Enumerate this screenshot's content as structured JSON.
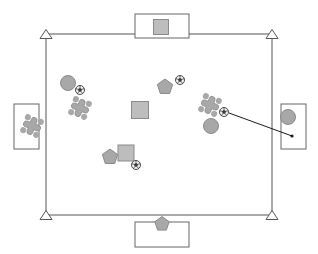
{
  "scene": {
    "title": "Soccer field tactical diagram",
    "canvas": {
      "width": 318,
      "height": 254,
      "background": "#ffffff"
    },
    "colors": {
      "line": "#555555",
      "shape_fill": "#a8a8a8",
      "shape_stroke": "#8a8a8a",
      "square_fill": "#bdbdbd",
      "goal_stroke": "#666666",
      "ball_dark": "#3a3a3a",
      "ball_light": "#f2f2f2",
      "pass_line": "#1a1a1a"
    }
  },
  "field": {
    "label": "playing field boundary",
    "left": 46,
    "top": 34,
    "right": 272,
    "bottom": 215,
    "stroke_width": 1
  },
  "corners": [
    {
      "name": "corner-marker-top-left",
      "label": "top left corner flag",
      "x": 46,
      "y": 34
    },
    {
      "name": "corner-marker-top-right",
      "label": "top right corner flag",
      "x": 272,
      "y": 34
    },
    {
      "name": "corner-marker-bottom-left",
      "label": "bottom left corner flag",
      "x": 46,
      "y": 215
    },
    {
      "name": "corner-marker-bottom-right",
      "label": "bottom right corner flag",
      "x": 272,
      "y": 215
    }
  ],
  "goals": [
    {
      "name": "goal-box-top",
      "label": "top goal box",
      "x": 135,
      "y": 14,
      "width": 54,
      "height": 24,
      "occupant": {
        "type": "square",
        "label": "square token in top goal",
        "cx": 161,
        "cy": 27,
        "size": 15
      }
    },
    {
      "name": "goal-box-bottom",
      "label": "bottom goal box",
      "x": 135,
      "y": 222,
      "width": 54,
      "height": 25,
      "occupant": {
        "type": "pentagon",
        "label": "pentagon token in bottom goal",
        "cx": 162,
        "cy": 224,
        "size": 15
      }
    },
    {
      "name": "goal-box-left",
      "label": "left goal box",
      "x": 14,
      "y": 104,
      "width": 25,
      "height": 45,
      "occupant": {
        "type": "cross",
        "label": "cross token in left goal",
        "cx": 32,
        "cy": 126,
        "size": 17
      }
    },
    {
      "name": "goal-box-right",
      "label": "right goal box",
      "x": 281,
      "y": 104,
      "width": 25,
      "height": 45,
      "occupant": {
        "type": "circle",
        "label": "circle token in right goal",
        "cx": 288,
        "cy": 117,
        "size": 15
      }
    }
  ],
  "tokens": [
    {
      "name": "token-circle-upper-left",
      "type": "circle",
      "label": "circle player upper left",
      "cx": 68,
      "cy": 83,
      "size": 15
    },
    {
      "name": "token-ball-upper-left",
      "type": "ball",
      "label": "ball near upper left circle",
      "cx": 80,
      "cy": 90,
      "size": 9
    },
    {
      "name": "token-cross-left",
      "type": "cross",
      "label": "cross player left of centre",
      "cx": 80,
      "cy": 108,
      "size": 17
    },
    {
      "name": "token-pentagon-upper",
      "type": "pentagon",
      "label": "pentagon player upper centre",
      "cx": 165,
      "cy": 87,
      "size": 16
    },
    {
      "name": "token-ball-upper-right",
      "type": "ball",
      "label": "ball near upper pentagon",
      "cx": 180,
      "cy": 80,
      "size": 9
    },
    {
      "name": "token-square-centre",
      "type": "square",
      "label": "square player centre",
      "cx": 140,
      "cy": 110,
      "size": 17
    },
    {
      "name": "token-cross-right",
      "type": "cross",
      "label": "cross player right of centre",
      "cx": 210,
      "cy": 105,
      "size": 17
    },
    {
      "name": "token-ball-right",
      "type": "ball",
      "label": "ball in play right side",
      "cx": 224,
      "cy": 112,
      "size": 9
    },
    {
      "name": "token-circle-right",
      "type": "circle",
      "label": "circle player right side",
      "cx": 211,
      "cy": 126,
      "size": 15
    },
    {
      "name": "token-pentagon-lower",
      "type": "pentagon",
      "label": "pentagon player lower left",
      "cx": 110,
      "cy": 157,
      "size": 16
    },
    {
      "name": "token-square-lower",
      "type": "square",
      "label": "square player lower centre",
      "cx": 126,
      "cy": 153,
      "size": 16
    },
    {
      "name": "token-ball-lower",
      "type": "ball",
      "label": "ball lower centre",
      "cx": 136,
      "cy": 165,
      "size": 9
    }
  ],
  "pass": {
    "name": "pass-trajectory",
    "label": "shot trajectory toward right goal",
    "from": {
      "x": 229,
      "y": 113
    },
    "to": {
      "x": 292,
      "y": 136
    },
    "stroke_width": 1
  }
}
